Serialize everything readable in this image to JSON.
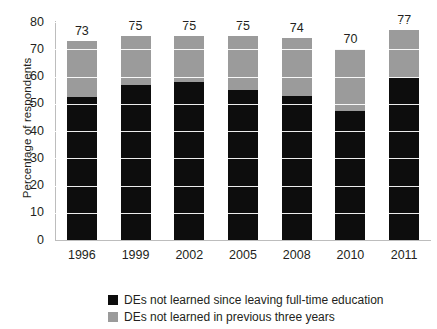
{
  "chart_data": {
    "type": "bar",
    "subtype": "stacked-bar",
    "title": "",
    "xlabel": "",
    "ylabel": "Percentage of respondents",
    "categories": [
      "1996",
      "1999",
      "2002",
      "2005",
      "2008",
      "2010",
      "2011"
    ],
    "series": [
      {
        "name": "DEs not learned since leaving full-time education",
        "color": "#0d0d0d",
        "values": [
          52.5,
          57,
          58,
          55,
          53,
          47.5,
          59.5
        ]
      },
      {
        "name": "DEs not learned in previous three years",
        "color": "#9b9b9b",
        "values": [
          20.5,
          18,
          17,
          20,
          21,
          22.5,
          17.5
        ]
      }
    ],
    "totals": [
      73,
      75,
      75,
      75,
      74,
      70,
      77
    ],
    "data_labels": [
      "73",
      "75",
      "75",
      "75",
      "74",
      "70",
      "77"
    ],
    "ylim": [
      0,
      80
    ],
    "ytick_values": [
      0,
      10,
      20,
      30,
      40,
      50,
      60,
      70,
      80
    ],
    "ytick_labels": [
      "0",
      "10",
      "20",
      "30",
      "40",
      "50",
      "60",
      "70",
      "80"
    ],
    "grid": "horizontal-white",
    "legend_position": "bottom"
  },
  "legend": {
    "items": [
      {
        "label": "DEs not learned since leaving full-time education",
        "color": "#0d0d0d",
        "swatch_name": "legend-swatch-black"
      },
      {
        "label": "DEs not learned in previous three years",
        "color": "#9b9b9b",
        "swatch_name": "legend-swatch-gray"
      }
    ]
  }
}
